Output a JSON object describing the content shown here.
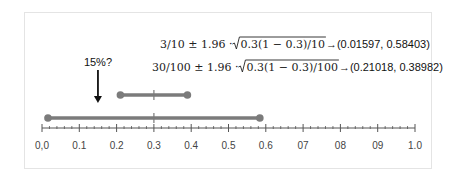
{
  "formulas": [
    {
      "prefix": "3/10 ± 1.96 · ",
      "radicand": "0.3(1 − 0.3)/10",
      "arrow": "→",
      "result": "(0.01597, 0.58403)"
    },
    {
      "prefix": "30/100 ± 1.96 · ",
      "radicand": "0.3(1 − 0.3)/100",
      "arrow": "→",
      "result": "(0.21018, 0.38982)"
    }
  ],
  "annotation": {
    "label": "15%?",
    "value": 0.15
  },
  "intervals": [
    {
      "name": "n=100",
      "low": 0.21018,
      "center": 0.3,
      "high": 0.38982
    },
    {
      "name": "n=10",
      "low": 0.01597,
      "center": 0.3,
      "high": 0.58403
    }
  ],
  "axis": {
    "min": 0.0,
    "max": 1.0,
    "major_step": 0.1,
    "minor_per_major": 5,
    "tick_labels": [
      "0,0",
      "0.1",
      "0.2",
      "0.3",
      "0.4",
      "0.5",
      "0.6",
      "07",
      "08",
      "09",
      "1.0"
    ]
  },
  "colors": {
    "interval": "#7b7b7b",
    "axis": "#555555",
    "arrow": "#111111",
    "frame": "#e4e4e4"
  }
}
